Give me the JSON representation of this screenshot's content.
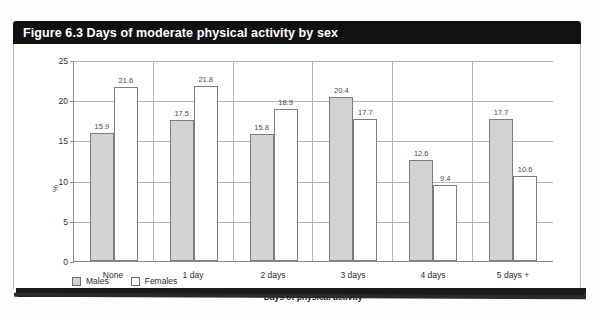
{
  "figure": {
    "title": "Figure 6.3 Days of moderate physical activity by sex",
    "colors": {
      "header_bg": "#111111",
      "header_text": "#ffffff",
      "male_bar": "#d2d2d2",
      "female_bar": "#ffffff",
      "bar_outline": "#7d7d7d",
      "gridline": "#b5b5b5"
    }
  },
  "chart_data": {
    "type": "bar",
    "title": "Figure 6.3 Days of moderate physical activity by sex",
    "xlabel": "Days of physical activity",
    "ylabel": "%",
    "ylim": [
      0,
      25
    ],
    "yticks": [
      0,
      5,
      10,
      15,
      20,
      25
    ],
    "grid": true,
    "legend_position": "bottom-left",
    "categories": [
      "None",
      "1 day",
      "2 days",
      "3 days",
      "4 days",
      "5 days +"
    ],
    "series": [
      {
        "name": "Males",
        "color": "#d2d2d2",
        "values": [
          15.9,
          17.5,
          15.8,
          20.4,
          12.6,
          17.7
        ],
        "labels": [
          "15.9",
          "17.5",
          "15.8",
          "20.4",
          "12.6",
          "17.7"
        ]
      },
      {
        "name": "Females",
        "color": "#ffffff",
        "values": [
          21.6,
          21.8,
          18.9,
          17.7,
          9.4,
          10.6
        ],
        "labels": [
          "21.6",
          "21.8",
          "18.9",
          "17.7",
          "9.4",
          "10.6"
        ]
      }
    ]
  }
}
